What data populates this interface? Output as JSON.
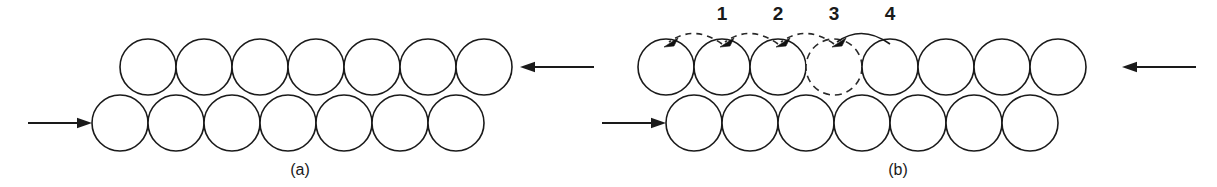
{
  "figure": {
    "type": "crystal-slip-diagram",
    "background_color": "#ffffff",
    "line_color": "#1a1a1a",
    "width": 1217,
    "height": 187
  },
  "panels": [
    {
      "id": "a",
      "label": "(a)",
      "label_x": 300,
      "label_y": 175,
      "description": "Two close-packed atomic rows before slip, loaded by opposing shear forces",
      "rows": [
        {
          "name": "top-row",
          "count": 7,
          "start_x": 148,
          "spacing": 56,
          "center_y": 67,
          "radius": 28,
          "style": "solid"
        },
        {
          "name": "bottom-row",
          "count": 7,
          "start_x": 120,
          "spacing": 56,
          "center_y": 123,
          "radius": 28,
          "style": "solid"
        }
      ],
      "force_arrows": [
        {
          "name": "lower-shear-arrow",
          "direction": "right",
          "x1": 28,
          "x2": 92,
          "y": 123
        },
        {
          "name": "upper-shear-arrow",
          "direction": "left",
          "x1": 594,
          "x2": 520,
          "y": 67
        }
      ],
      "hops": []
    },
    {
      "id": "b",
      "label": "(b)",
      "label_x": 898,
      "label_y": 175,
      "description": "Dislocation glide: atoms hop one position to the left in sequence 1, 2, 3, 4",
      "rows": [
        {
          "name": "top-row",
          "count": 8,
          "start_x": 666,
          "spacing": 56,
          "center_y": 67,
          "radius": 28,
          "style": "solid",
          "ghost_index": 3
        },
        {
          "name": "bottom-row",
          "count": 7,
          "start_x": 694,
          "spacing": 56,
          "center_y": 123,
          "radius": 28,
          "style": "solid"
        }
      ],
      "force_arrows": [
        {
          "name": "lower-shear-arrow",
          "direction": "right",
          "x1": 602,
          "x2": 666,
          "y": 123
        },
        {
          "name": "upper-shear-arrow",
          "direction": "left",
          "x1": 1196,
          "x2": 1122,
          "y": 67
        }
      ],
      "hops": [
        {
          "label": "1",
          "label_x": 722,
          "label_y": 20,
          "from_x": 722,
          "to_x": 666,
          "apex_y": 30,
          "end_y": 44,
          "style": "dashed"
        },
        {
          "label": "2",
          "label_x": 778,
          "label_y": 20,
          "from_x": 778,
          "to_x": 722,
          "apex_y": 30,
          "end_y": 44,
          "style": "dashed"
        },
        {
          "label": "3",
          "label_x": 834,
          "label_y": 20,
          "from_x": 834,
          "to_x": 778,
          "apex_y": 30,
          "end_y": 44,
          "style": "dashed"
        },
        {
          "label": "4",
          "label_x": 890,
          "label_y": 20,
          "from_x": 890,
          "to_x": 834,
          "apex_y": 30,
          "end_y": 44,
          "style": "solid"
        }
      ]
    }
  ]
}
